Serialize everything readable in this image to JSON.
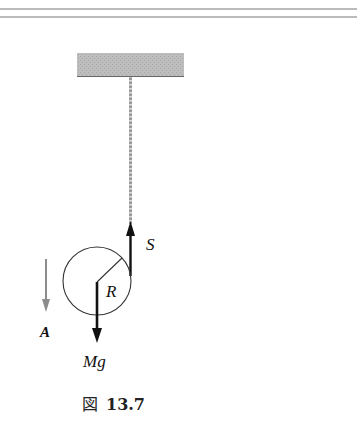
{
  "figure": {
    "caption_prefix": "図",
    "caption_number": "13.7",
    "labels": {
      "tension": "S",
      "radius": "R",
      "weight": "Mg",
      "acceleration": "A"
    },
    "colors": {
      "ceiling": "#b8b8b8",
      "rope": "#8a8a8a",
      "force_arrow": "#111111",
      "accel_arrow": "#8c8c8c",
      "rule": "#777777"
    }
  }
}
